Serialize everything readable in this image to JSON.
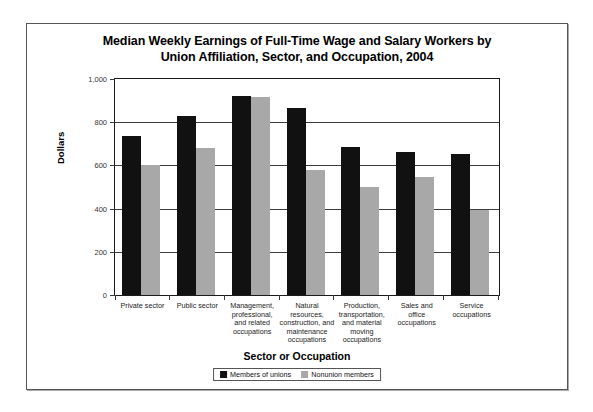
{
  "chart_data": {
    "type": "bar",
    "title": "Median Weekly Earnings of Full-Time Wage and Salary Workers by Union Affiliation, Sector, and Occupation, 2004",
    "title_lines": [
      "Median Weekly Earnings of Full-Time Wage and Salary Workers by",
      "Union Affiliation, Sector, and Occupation, 2004"
    ],
    "xlabel": "Sector or Occupation",
    "ylabel": "Dollars",
    "ylim": [
      0,
      1000
    ],
    "ytick_labels": [
      "1,000",
      "800",
      "600",
      "400",
      "200",
      "0"
    ],
    "ytick_values": [
      1000,
      800,
      600,
      400,
      200,
      0
    ],
    "grid": true,
    "legend_position": "bottom",
    "categories": [
      "Private sector",
      "Public sector",
      "Management, professional, and related occupations",
      "Natural resources, construction, and maintenance occupations",
      "Production, transportation, and material moving occupations",
      "Sales and office occupations",
      "Service occupations"
    ],
    "category_lines": [
      [
        "Private sector"
      ],
      [
        "Public sector"
      ],
      [
        "Management,",
        "professional,",
        "and related",
        "occupations"
      ],
      [
        "Natural",
        "resources,",
        "construction, and",
        "maintenance",
        "occupations"
      ],
      [
        "Production,",
        "transportation,",
        "and material",
        "moving",
        "occupations"
      ],
      [
        "Sales and",
        "office",
        "occupations"
      ],
      [
        "Service",
        "occupations"
      ]
    ],
    "series": [
      {
        "name": "Members of unions",
        "color": "#111111",
        "values": [
          735,
          830,
          920,
          865,
          685,
          660,
          655
        ]
      },
      {
        "name": "Nonunion members",
        "color": "#a8a8a8",
        "values": [
          600,
          680,
          915,
          580,
          500,
          545,
          395
        ]
      }
    ]
  }
}
